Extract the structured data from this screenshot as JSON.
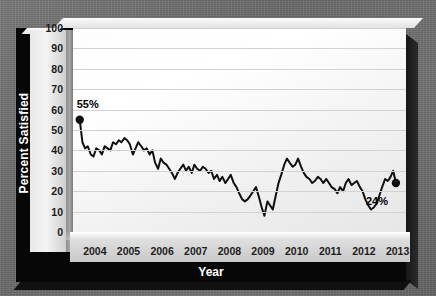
{
  "chart_data": {
    "type": "line",
    "title": "",
    "xlabel": "Year",
    "ylabel": "Percent Satisfied",
    "ylim": [
      0,
      100
    ],
    "ytick_values": [
      100,
      90,
      80,
      70,
      60,
      50,
      40,
      30,
      20,
      10,
      0
    ],
    "xtick_labels": [
      "2004",
      "2005",
      "2006",
      "2007",
      "2008",
      "2009",
      "2010",
      "2011",
      "2012",
      "2013"
    ],
    "grid": true,
    "legend": "none",
    "line_color": "#101010",
    "annotations": [
      {
        "label": "55%",
        "value": 55,
        "x": "2004",
        "position": "above-left-endpoint"
      },
      {
        "label": "24%",
        "value": 24,
        "x": "2013",
        "position": "below-right-endpoint"
      }
    ],
    "markers": [
      {
        "x": 2004.05,
        "y": 55
      },
      {
        "x": 2013.45,
        "y": 24
      }
    ],
    "series": [
      {
        "name": "Percent Satisfied",
        "x": [
          2004.05,
          2004.13,
          2004.21,
          2004.29,
          2004.38,
          2004.46,
          2004.54,
          2004.63,
          2004.71,
          2004.79,
          2004.88,
          2004.96,
          2005.04,
          2005.13,
          2005.21,
          2005.29,
          2005.38,
          2005.46,
          2005.54,
          2005.63,
          2005.71,
          2005.79,
          2005.88,
          2005.96,
          2006.04,
          2006.13,
          2006.21,
          2006.29,
          2006.38,
          2006.46,
          2006.54,
          2006.63,
          2006.71,
          2006.79,
          2006.88,
          2006.96,
          2007.04,
          2007.13,
          2007.21,
          2007.29,
          2007.38,
          2007.46,
          2007.54,
          2007.63,
          2007.71,
          2007.79,
          2007.88,
          2007.96,
          2008.04,
          2008.13,
          2008.21,
          2008.29,
          2008.38,
          2008.46,
          2008.54,
          2008.63,
          2008.71,
          2008.79,
          2008.88,
          2008.96,
          2009.04,
          2009.13,
          2009.21,
          2009.29,
          2009.38,
          2009.46,
          2009.54,
          2009.63,
          2009.71,
          2009.79,
          2009.88,
          2009.96,
          2010.04,
          2010.13,
          2010.21,
          2010.29,
          2010.38,
          2010.46,
          2010.54,
          2010.63,
          2010.71,
          2010.79,
          2010.88,
          2010.96,
          2011.04,
          2011.13,
          2011.21,
          2011.29,
          2011.38,
          2011.46,
          2011.54,
          2011.63,
          2011.71,
          2011.79,
          2011.88,
          2011.96,
          2012.04,
          2012.13,
          2012.21,
          2012.29,
          2012.38,
          2012.46,
          2012.54,
          2012.63,
          2012.71,
          2012.79,
          2012.88,
          2012.96,
          2013.04,
          2013.13,
          2013.21,
          2013.29,
          2013.37,
          2013.45
        ],
        "values": [
          55,
          44,
          41,
          42,
          38,
          37,
          41,
          40,
          38,
          42,
          41,
          40,
          44,
          43,
          45,
          44,
          46,
          45,
          43,
          38,
          41,
          44,
          42,
          40,
          41,
          38,
          40,
          34,
          31,
          36,
          34,
          33,
          31,
          29,
          26,
          29,
          31,
          33,
          30,
          32,
          29,
          33,
          31,
          30,
          32,
          31,
          29,
          30,
          26,
          28,
          25,
          27,
          24,
          26,
          28,
          24,
          22,
          19,
          16,
          15,
          16,
          18,
          20,
          22,
          17,
          12,
          8,
          15,
          13,
          11,
          18,
          24,
          28,
          33,
          36,
          34,
          32,
          33,
          36,
          32,
          29,
          27,
          26,
          24,
          25,
          27,
          26,
          24,
          26,
          24,
          22,
          21,
          19,
          22,
          20,
          24,
          26,
          23,
          24,
          25,
          22,
          20,
          16,
          13,
          11,
          12,
          14,
          18,
          22,
          26,
          25,
          27,
          30,
          24
        ]
      }
    ]
  },
  "axis": {
    "y_title": "Percent Satisfied",
    "x_title": "Year"
  }
}
